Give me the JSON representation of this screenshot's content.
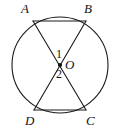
{
  "figure": {
    "type": "geometry-diagram",
    "width": 119,
    "height": 129,
    "background_color": "#ffffff",
    "stroke_color": "#1a1a1a",
    "circle": {
      "center_label": "O",
      "center_x": 60,
      "center_y": 65,
      "radius": 48,
      "stroke_width": 1.1
    },
    "center_point": {
      "label": "O",
      "x": 60,
      "y": 65,
      "dot_radius": 2.1
    },
    "points": [
      {
        "label": "A",
        "x": 33,
        "y": 21
      },
      {
        "label": "B",
        "x": 86,
        "y": 21
      },
      {
        "label": "C",
        "x": 86,
        "y": 110
      },
      {
        "label": "D",
        "x": 34,
        "y": 110
      }
    ],
    "segments": [
      {
        "name": "chord-AB",
        "from": "A",
        "to": "B",
        "x1": 33,
        "y1": 21,
        "x2": 86,
        "y2": 21
      },
      {
        "name": "chord-DC",
        "from": "D",
        "to": "C",
        "x1": 34,
        "y1": 110,
        "x2": 86,
        "y2": 110
      },
      {
        "name": "chord-AC",
        "from": "A",
        "to": "C",
        "x1": 33,
        "y1": 21,
        "x2": 86,
        "y2": 110
      },
      {
        "name": "chord-BD",
        "from": "B",
        "to": "D",
        "x1": 86,
        "y1": 21,
        "x2": 34,
        "y2": 110
      }
    ],
    "angle_labels": [
      {
        "label": "1",
        "x": 59,
        "y": 54,
        "position": "above-center"
      },
      {
        "label": "2",
        "x": 59,
        "y": 74,
        "position": "below-center"
      }
    ],
    "labels": {
      "A": "A",
      "B": "B",
      "C": "C",
      "D": "D",
      "O": "O",
      "angle1": "1",
      "angle2": "2"
    }
  }
}
